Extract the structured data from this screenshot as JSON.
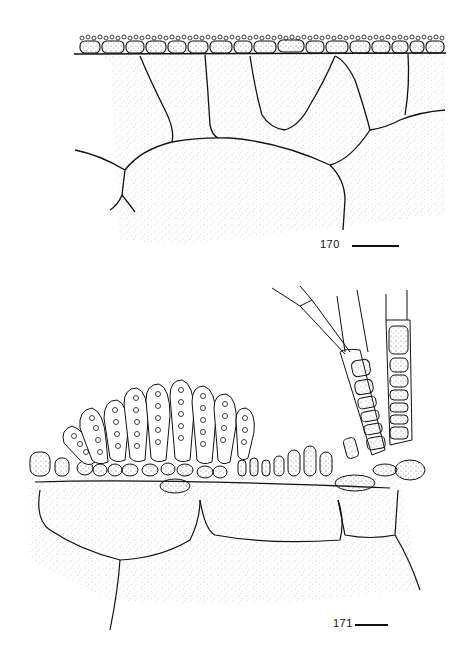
{
  "figures": [
    {
      "number": "170",
      "description": "Cross-section: surface layer of small cortical cells with surface granules over large stippled medullary cells",
      "scale_bar": {
        "present": true,
        "width_px": 47
      }
    },
    {
      "number": "171",
      "description": "Cross-section: cluster of sporangia (club-shaped, filled with spores) on surface cortical cells, with multicellular filaments/hairs emerging at right, over large stippled medullary cells",
      "scale_bar": {
        "present": true,
        "width_px": 33
      }
    }
  ],
  "colors": {
    "ink": "#111111",
    "background": "#ffffff",
    "stipple": "#555555"
  }
}
